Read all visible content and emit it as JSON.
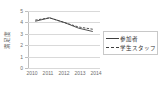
{
  "chart_data": {
    "type": "line",
    "title": "",
    "xlabel": "",
    "ylabel": "満足度",
    "categories": [
      "2010",
      "2011",
      "2012",
      "2013",
      "2014"
    ],
    "ylim": [
      0,
      5
    ],
    "yticks": [
      "0",
      "1",
      "2",
      "3",
      "4",
      "5"
    ],
    "grid": true,
    "legend_position": "right",
    "series": [
      {
        "name": "参加者",
        "style": "solid",
        "color": "#3f3f3f",
        "values": [
          4.1,
          4.4,
          4.0,
          3.5,
          3.2
        ]
      },
      {
        "name": "学生スタッフ",
        "style": "dashed",
        "color": "#3f3f3f",
        "values": [
          4.2,
          4.4,
          4.0,
          3.6,
          3.4
        ]
      }
    ]
  },
  "legend": {
    "items": [
      {
        "label": "参加者"
      },
      {
        "label": "学生スタッフ"
      }
    ]
  },
  "axis": {
    "y_title": "満足度",
    "y_ticks": [
      "5",
      "4",
      "3",
      "2",
      "1",
      "0"
    ],
    "x_ticks": [
      "2010",
      "2011",
      "2012",
      "2013",
      "2014"
    ]
  },
  "colors": {
    "series_line": "#3f3f3f",
    "gridline": "#d9d9d9",
    "axis": "#bfbfbf",
    "tick_text": "#6e6e6e",
    "background": "#ffffff"
  }
}
